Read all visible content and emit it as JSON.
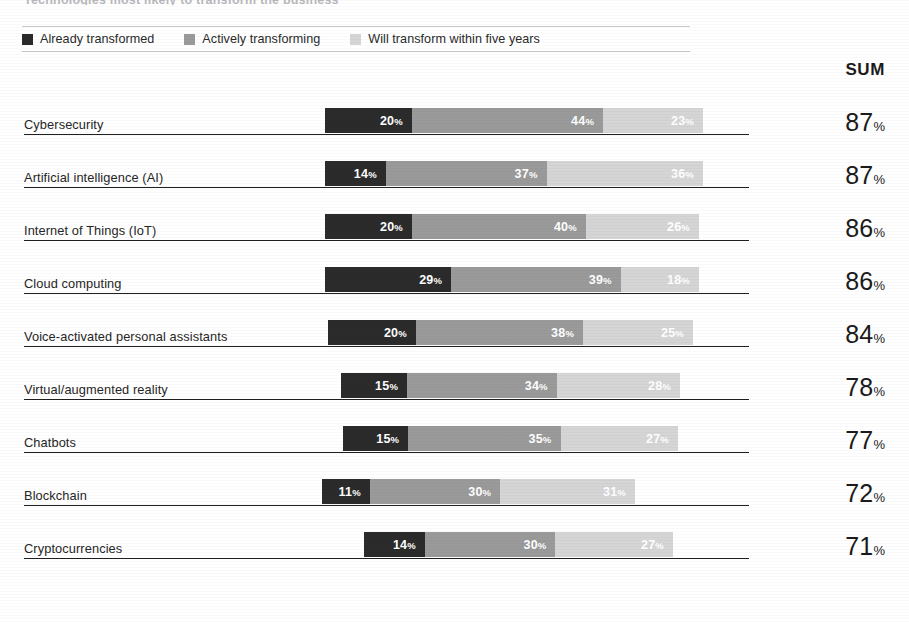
{
  "clipped_title": "Technologies most likely to transform the business",
  "legend": {
    "items": [
      {
        "label": "Already transformed",
        "color": "#2b2b2b",
        "key": "already"
      },
      {
        "label": "Actively transforming",
        "color": "#9a9a9a",
        "key": "active"
      },
      {
        "label": "Will transform within five years",
        "color": "#d5d5d5",
        "key": "future"
      }
    ]
  },
  "sum_header": "SUM",
  "percent_symbol": "%",
  "chart_data": {
    "type": "bar",
    "orientation": "horizontal",
    "stacked": true,
    "title": "Technologies most likely to transform the business",
    "subtitle": "",
    "xlabel": "",
    "ylabel": "",
    "grid": false,
    "legend_position": "top",
    "series": [
      {
        "name": "Already transformed",
        "color": "#2b2b2b",
        "values": [
          20,
          14,
          20,
          29,
          20,
          15,
          15,
          11,
          14
        ]
      },
      {
        "name": "Actively transforming",
        "color": "#9a9a9a",
        "values": [
          44,
          37,
          40,
          39,
          38,
          34,
          35,
          30,
          30
        ]
      },
      {
        "name": "Will transform within five years",
        "color": "#d5d5d5",
        "values": [
          23,
          36,
          26,
          18,
          25,
          28,
          27,
          31,
          27
        ]
      }
    ],
    "categories": [
      "Cybersecurity",
      "Artificial intelligence (AI)",
      "Internet of Things (IoT)",
      "Cloud computing",
      "Voice-activated personal assistants",
      "Virtual/augmented reality",
      "Chatbots",
      "Blockchain",
      "Cryptocurrencies"
    ],
    "sums": [
      87,
      87,
      86,
      86,
      84,
      78,
      77,
      72,
      71
    ],
    "value_suffix": "%"
  },
  "rows": [
    {
      "label": "Cybersecurity",
      "already": "20",
      "active": "44",
      "future": "23",
      "sum": "87",
      "bar_left": 325,
      "bar_width": 378
    },
    {
      "label": "Artificial intelligence (AI)",
      "already": "14",
      "active": "37",
      "future": "36",
      "sum": "87",
      "bar_left": 325,
      "bar_width": 378
    },
    {
      "label": "Internet of Things (IoT)",
      "already": "20",
      "active": "40",
      "future": "26",
      "sum": "86",
      "bar_left": 325,
      "bar_width": 374
    },
    {
      "label": "Cloud computing",
      "already": "29",
      "active": "39",
      "future": "18",
      "sum": "86",
      "bar_left": 325,
      "bar_width": 374
    },
    {
      "label": "Voice-activated personal assistants",
      "already": "20",
      "active": "38",
      "future": "25",
      "sum": "84",
      "bar_left": 328,
      "bar_width": 365
    },
    {
      "label": "Virtual/augmented reality",
      "already": "15",
      "active": "34",
      "future": "28",
      "sum": "78",
      "bar_left": 341,
      "bar_width": 339
    },
    {
      "label": "Chatbots",
      "already": "15",
      "active": "35",
      "future": "27",
      "sum": "77",
      "bar_left": 343,
      "bar_width": 335
    },
    {
      "label": "Blockchain",
      "already": "11",
      "active": "30",
      "future": "31",
      "sum": "72",
      "bar_left": 322,
      "bar_width": 313
    },
    {
      "label": "Cryptocurrencies",
      "already": "14",
      "active": "30",
      "future": "27",
      "sum": "71",
      "bar_left": 364,
      "bar_width": 309
    }
  ]
}
